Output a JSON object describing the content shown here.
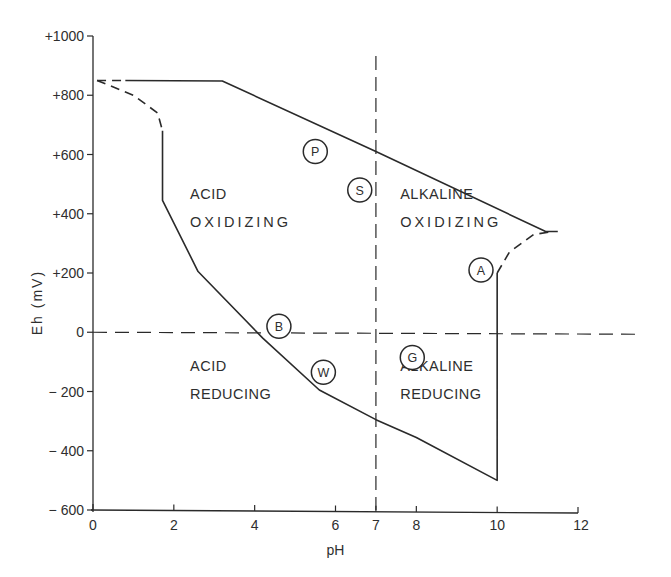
{
  "chart_data": {
    "type": "line",
    "title": "",
    "xlabel": "pH",
    "ylabel": "Eh (mV)",
    "xlim": [
      0,
      12
    ],
    "ylim": [
      -600,
      1000
    ],
    "grid": false,
    "x_ticks": [
      "0",
      "2",
      "4",
      "6",
      "7",
      "8",
      "10",
      "12"
    ],
    "y_ticks": [
      "+1000",
      "+800",
      "+600",
      "+400",
      "+200",
      "0",
      "-200",
      "-400",
      "-600"
    ],
    "reference_lines": [
      {
        "name": "neutral pH",
        "orientation": "vertical",
        "x": 7,
        "style": "dashed"
      },
      {
        "name": "zero Eh",
        "orientation": "horizontal",
        "y": 0,
        "style": "dashed"
      }
    ],
    "series": [
      {
        "name": "upper boundary (solid)",
        "style": "solid",
        "points": [
          [
            0.8,
            850
          ],
          [
            3.2,
            848
          ],
          [
            7.0,
            610
          ],
          [
            11.2,
            340
          ],
          [
            11.5,
            340
          ]
        ]
      },
      {
        "name": "upper-left boundary (dashed)",
        "style": "dashed",
        "points": [
          [
            0.1,
            850
          ],
          [
            0.8,
            850
          ]
        ]
      },
      {
        "name": "left boundary curve (dashed)",
        "style": "dashed",
        "points": [
          [
            0.1,
            850
          ],
          [
            1.0,
            800
          ],
          [
            1.6,
            740
          ],
          [
            1.72,
            680
          ]
        ]
      },
      {
        "name": "left/lower boundary (solid)",
        "style": "solid",
        "points": [
          [
            1.72,
            680
          ],
          [
            1.72,
            445
          ],
          [
            2.6,
            205
          ],
          [
            4.2,
            -20
          ],
          [
            5.6,
            -195
          ],
          [
            7.0,
            -295
          ],
          [
            8.0,
            -355
          ],
          [
            10.0,
            -500
          ],
          [
            10.0,
            200
          ]
        ]
      },
      {
        "name": "upper-right boundary (dashed)",
        "style": "dashed",
        "points": [
          [
            10.0,
            200
          ],
          [
            10.3,
            270
          ],
          [
            10.9,
            330
          ],
          [
            11.4,
            340
          ]
        ]
      }
    ],
    "regions": [
      {
        "label_lines": [
          "ACID",
          "OXIDIZING"
        ],
        "x": 2.4,
        "y": 430
      },
      {
        "label_lines": [
          "ALKALINE",
          "OXIDIZING"
        ],
        "x": 7.6,
        "y": 430
      },
      {
        "label_lines": [
          "ACID",
          "REDUCING"
        ],
        "x": 2.4,
        "y": -150
      },
      {
        "label_lines": [
          "ALKALINE",
          "REDUCING"
        ],
        "x": 7.6,
        "y": -150
      }
    ],
    "markers": [
      {
        "label": "P",
        "x": 5.5,
        "y": 610
      },
      {
        "label": "S",
        "x": 6.6,
        "y": 480
      },
      {
        "label": "A",
        "x": 9.6,
        "y": 210
      },
      {
        "label": "B",
        "x": 4.6,
        "y": 20
      },
      {
        "label": "W",
        "x": 5.7,
        "y": -135
      },
      {
        "label": "G",
        "x": 7.9,
        "y": -85
      }
    ]
  },
  "axes": {
    "x_title": "pH",
    "y_title": "Eh (mV)",
    "x_ticks": [
      {
        "value": 0,
        "label": "0"
      },
      {
        "value": 2,
        "label": "2"
      },
      {
        "value": 4,
        "label": "4"
      },
      {
        "value": 6,
        "label": "6"
      },
      {
        "value": 7,
        "label": "7"
      },
      {
        "value": 8,
        "label": "8"
      },
      {
        "value": 10,
        "label": "10"
      },
      {
        "value": 12,
        "label": "12"
      }
    ],
    "y_ticks": [
      {
        "value": 1000,
        "label": "+1000"
      },
      {
        "value": 800,
        "label": "+800"
      },
      {
        "value": 600,
        "label": "+600"
      },
      {
        "value": 400,
        "label": "+400"
      },
      {
        "value": 200,
        "label": "+200"
      },
      {
        "value": 0,
        "label": "0"
      },
      {
        "value": -200,
        "label": "-200"
      },
      {
        "value": -400,
        "label": "-400"
      },
      {
        "value": -600,
        "label": "-600"
      }
    ]
  },
  "colors": {
    "ink": "#2a2a2a",
    "background": "#ffffff"
  }
}
